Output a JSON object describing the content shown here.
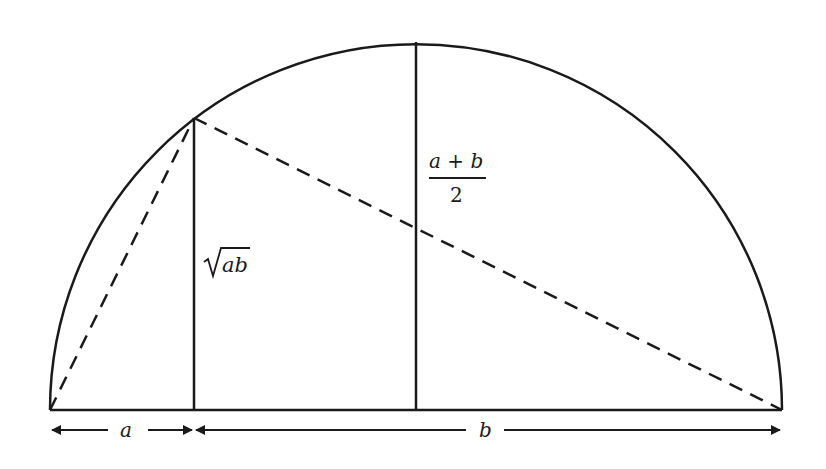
{
  "diagram": {
    "labels": {
      "segment_a": "a",
      "segment_b": "b",
      "geometric_mean_radicand": "ab",
      "arithmetic_mean_numerator": "a + b",
      "arithmetic_mean_denominator": "2"
    },
    "colors": {
      "stroke": "#1a1a1a",
      "background": "#ffffff"
    },
    "geometry": {
      "baseline_y": 410,
      "left_x": 50,
      "right_x": 782,
      "center_x": 416,
      "radius": 366,
      "perpendicular_x": 194,
      "perpendicular_top_y": 118
    }
  }
}
